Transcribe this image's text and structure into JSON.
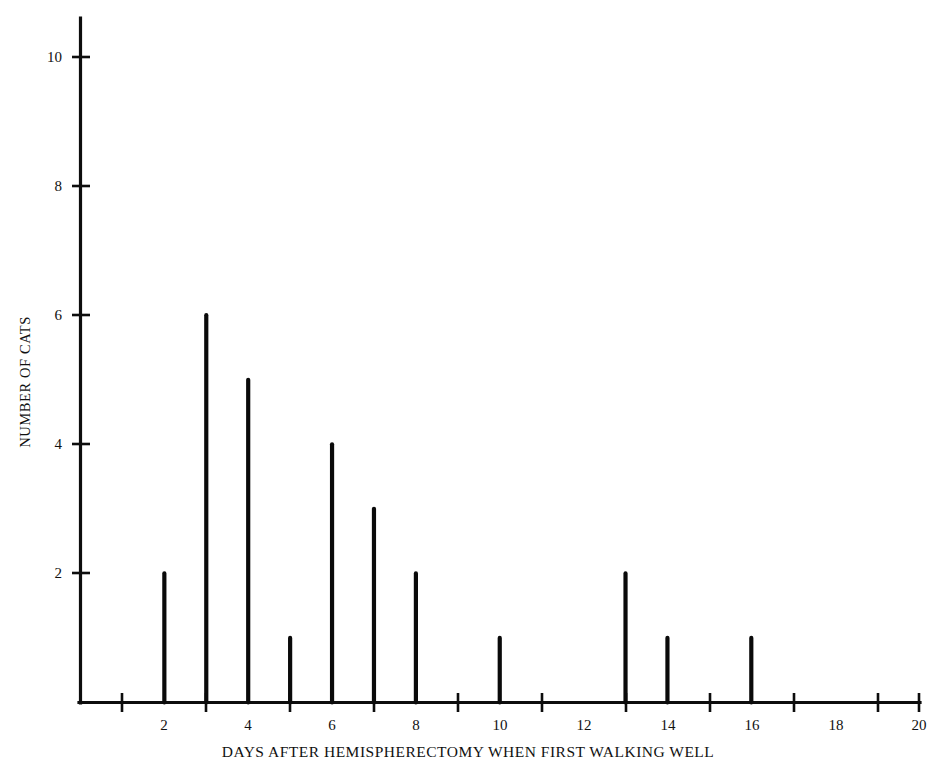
{
  "chart_data": {
    "type": "bar",
    "title": "",
    "xlabel": "DAYS AFTER HEMISPHERECTOMY WHEN FIRST WALKING WELL",
    "ylabel": "NUMBER OF CATS",
    "xlim": [
      0,
      20
    ],
    "ylim": [
      0,
      10.8
    ],
    "grid": false,
    "legend": null,
    "x_tick_labels": [
      "2",
      "4",
      "6",
      "8",
      "10",
      "12",
      "14",
      "16",
      "18",
      "20"
    ],
    "x_tick_label_values": [
      2,
      4,
      6,
      8,
      10,
      12,
      14,
      16,
      18,
      20
    ],
    "x_tick_mark_values": [
      1,
      3,
      5,
      7,
      9,
      11,
      13,
      15,
      17,
      19,
      20
    ],
    "y_tick_labels": [
      "2",
      "4",
      "6",
      "8",
      "10"
    ],
    "y_tick_label_values": [
      2,
      4,
      6,
      8,
      10
    ],
    "categories": [
      1,
      2,
      3,
      4,
      5,
      6,
      7,
      8,
      9,
      10,
      11,
      12,
      13,
      14,
      15,
      16,
      17,
      18,
      19,
      20
    ],
    "values": [
      0,
      2,
      6,
      5,
      1,
      4,
      3,
      2,
      0,
      1,
      0,
      0,
      2,
      1,
      0,
      1,
      0,
      0,
      0,
      0
    ],
    "points": [
      {
        "x": 2,
        "y": 2
      },
      {
        "x": 3,
        "y": 6
      },
      {
        "x": 4,
        "y": 5
      },
      {
        "x": 5,
        "y": 1
      },
      {
        "x": 6,
        "y": 4
      },
      {
        "x": 7,
        "y": 3
      },
      {
        "x": 8,
        "y": 2
      },
      {
        "x": 10,
        "y": 1
      },
      {
        "x": 13,
        "y": 2
      },
      {
        "x": 14,
        "y": 1
      },
      {
        "x": 16,
        "y": 1
      }
    ],
    "colors": {
      "spike": "#0a0a0a",
      "axis": "#0d0d0d",
      "background": "#ffffff",
      "text": "#111111"
    }
  }
}
